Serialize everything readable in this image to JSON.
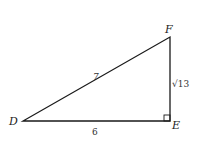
{
  "diagram": {
    "type": "right-triangle",
    "vertices": {
      "D": {
        "label": "D",
        "x": 23,
        "y": 121
      },
      "E": {
        "label": "E",
        "x": 170,
        "y": 121
      },
      "F": {
        "label": "F",
        "x": 170,
        "y": 37
      }
    },
    "sides": {
      "DF": {
        "label": "7"
      },
      "DE": {
        "label": "6"
      },
      "EF": {
        "label": "√13"
      }
    },
    "right_angle_at": "E",
    "colors": {
      "stroke": "#1a1a1a",
      "background": "#ffffff"
    }
  }
}
